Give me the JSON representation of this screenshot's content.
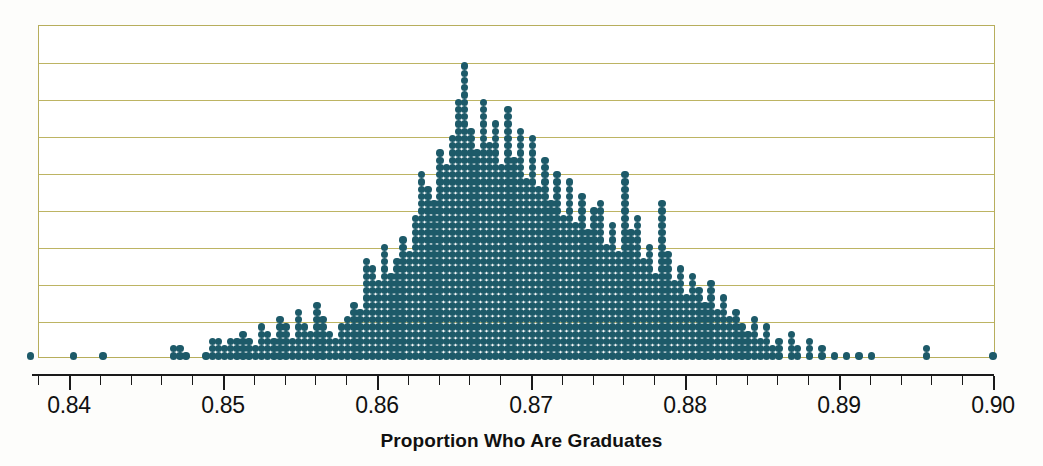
{
  "chart_data": {
    "type": "dotplot",
    "title": "",
    "xlabel": "Proportion Who Are Graduates",
    "ylabel": "",
    "xlim": [
      0.8375,
      0.9005
    ],
    "grid": true,
    "gridline_count": 8,
    "dot_color": "#1d5a69",
    "gridline_color": "#bdb463",
    "axis_color": "#1a1a1a",
    "dot_unit": 1,
    "tick_labels": [
      "0.84",
      "0.85",
      "0.86",
      "0.87",
      "0.88",
      "0.89",
      "0.90"
    ],
    "tick_values": [
      0.84,
      0.85,
      0.86,
      0.87,
      0.88,
      0.89,
      0.9
    ],
    "minor_tick_step": 0.002,
    "x": [
      0.8375,
      0.8403,
      0.8422,
      0.8468,
      0.8472,
      0.8476,
      0.8489,
      0.8493,
      0.8497,
      0.8501,
      0.8505,
      0.8509,
      0.8513,
      0.8517,
      0.8521,
      0.8525,
      0.8529,
      0.8533,
      0.8537,
      0.8541,
      0.8545,
      0.8549,
      0.8553,
      0.8557,
      0.8561,
      0.8565,
      0.8569,
      0.8573,
      0.8577,
      0.8581,
      0.8585,
      0.8589,
      0.8593,
      0.8597,
      0.8601,
      0.8605,
      0.8609,
      0.8613,
      0.8617,
      0.8621,
      0.8625,
      0.8629,
      0.8633,
      0.8637,
      0.8641,
      0.8645,
      0.8649,
      0.8653,
      0.8657,
      0.8661,
      0.8665,
      0.8669,
      0.8673,
      0.8677,
      0.8681,
      0.8685,
      0.8689,
      0.8693,
      0.8697,
      0.8701,
      0.8705,
      0.8709,
      0.8713,
      0.8717,
      0.8721,
      0.8725,
      0.8729,
      0.8733,
      0.8737,
      0.8741,
      0.8745,
      0.8749,
      0.8753,
      0.8757,
      0.8761,
      0.8765,
      0.8769,
      0.8773,
      0.8777,
      0.8781,
      0.8785,
      0.8789,
      0.8793,
      0.8797,
      0.8801,
      0.8805,
      0.8809,
      0.8813,
      0.8817,
      0.8821,
      0.8825,
      0.8829,
      0.8833,
      0.8837,
      0.8841,
      0.8845,
      0.8849,
      0.8853,
      0.8857,
      0.8861,
      0.8869,
      0.8873,
      0.8881,
      0.8889,
      0.8897,
      0.8905,
      0.8913,
      0.8921,
      0.8957,
      0.9
    ],
    "counts": [
      1,
      1,
      1,
      2,
      2,
      1,
      1,
      3,
      3,
      2,
      3,
      3,
      4,
      3,
      2,
      5,
      4,
      3,
      6,
      5,
      3,
      7,
      5,
      4,
      8,
      6,
      4,
      3,
      5,
      6,
      8,
      7,
      14,
      13,
      11,
      16,
      12,
      14,
      17,
      15,
      20,
      26,
      24,
      22,
      29,
      27,
      31,
      36,
      41,
      32,
      29,
      36,
      30,
      33,
      27,
      35,
      28,
      32,
      25,
      31,
      24,
      28,
      22,
      26,
      20,
      25,
      19,
      23,
      18,
      21,
      22,
      16,
      19,
      15,
      26,
      18,
      20,
      14,
      16,
      12,
      22,
      15,
      11,
      13,
      9,
      12,
      10,
      8,
      11,
      7,
      9,
      6,
      7,
      5,
      4,
      6,
      3,
      5,
      2,
      3,
      4,
      2,
      3,
      2,
      1,
      1,
      1,
      1,
      2,
      1
    ]
  }
}
